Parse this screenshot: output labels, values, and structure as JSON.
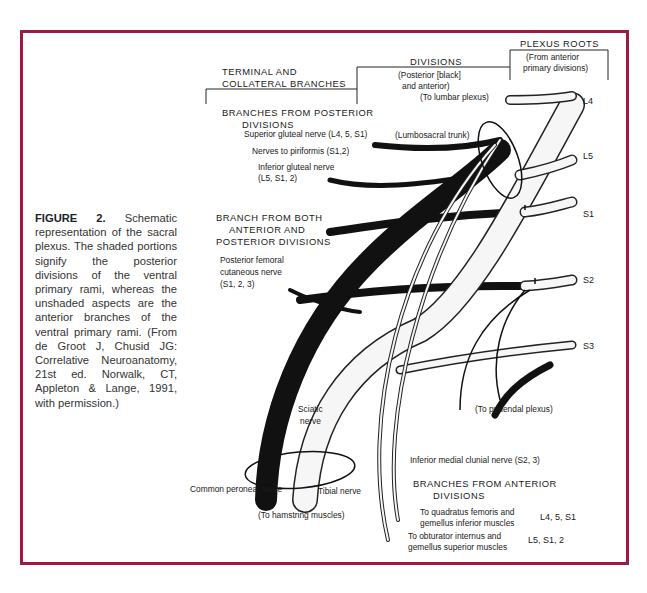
{
  "figure": {
    "border_color": "#9b1c3c",
    "caption": {
      "label": "FIGURE 2.",
      "text": "Schematic representation of the sacral plexus. The shaded portions signify the posterior divisions of the ventral primary rami, whereas the unshaded aspects are the anterior branches of the ventral primary rami. (From de Groot J, Chusid JG: Correlative Neuroanatomy, 21st ed. Norwalk, CT, Appleton & Lange, 1991, with permission.)"
    }
  },
  "headers": {
    "terminal": [
      "TERMINAL AND",
      "COLLATERAL BRANCHES"
    ],
    "divisions": "DIVISIONS",
    "divisions_note": [
      "(Posterior [black]",
      "and anterior)"
    ],
    "plexus_roots": "PLEXUS ROOTS",
    "plexus_roots_note": [
      "(From anterior",
      "primary divisions)"
    ]
  },
  "roots": [
    "L4",
    "L5",
    "S1",
    "S2",
    "S3"
  ],
  "labels": {
    "to_lumbar_plexus": "(To lumbar plexus)",
    "lumbosacral_trunk": "(Lumbosacral trunk)",
    "posterior_header": [
      "BRANCHES FROM POSTERIOR",
      "DIVISIONS"
    ],
    "superior_gluteal": "Superior gluteal nerve (L4, 5, S1)",
    "piriformis": "Nerves to piriformis (S1,2)",
    "inferior_gluteal": [
      "Inferior gluteal nerve",
      "(L5, S1, 2)"
    ],
    "both_header": [
      "BRANCH FROM BOTH",
      "ANTERIOR AND",
      "POSTERIOR DIVISIONS"
    ],
    "post_fem_cut": [
      "Posterior femoral",
      "cutaneous nerve",
      "(S1, 2, 3)"
    ],
    "to_pudendal": "(To pudendal plexus)",
    "sciatic": [
      "Sciatic",
      "nerve"
    ],
    "common_peroneal": "Common peroneal nerve",
    "tibial": "Tibial nerve",
    "hamstring": "(To hamstring muscles)",
    "inf_med_clunial": "Inferior medial clunial nerve (S2, 3)",
    "anterior_header": [
      "BRANCHES FROM ANTERIOR",
      "DIVISIONS"
    ],
    "quadratus": [
      "To quadratus femoris and",
      "gemellus inferior muscles"
    ],
    "quadratus_roots": "L4, 5, S1",
    "obturator": [
      "To obturator internus and",
      "gemellus superior muscles"
    ],
    "obturator_roots": "L5, S1, 2"
  }
}
